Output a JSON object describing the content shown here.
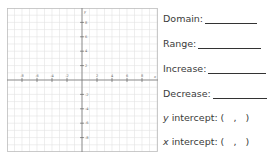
{
  "graph": {
    "x_axis_label": "x",
    "y_axis_label": "y",
    "x_ticks": [
      "-8",
      "-6",
      "-4",
      "-2",
      "2",
      "4",
      "6",
      "8"
    ],
    "y_ticks": [
      "8",
      "6",
      "4",
      "2",
      "-2",
      "-4",
      "-6",
      "-8"
    ],
    "grid_range": [
      -10,
      10
    ]
  },
  "worksheet": {
    "domain_label": "Domain:",
    "range_label": "Range:",
    "increase_label": "Increase:",
    "decrease_label": "Decrease:",
    "y_intercept": {
      "var": "y",
      "label": " intercept: (   ,   )"
    },
    "x_intercept": {
      "var": "x",
      "label": " intercept: (   ,   )"
    }
  }
}
